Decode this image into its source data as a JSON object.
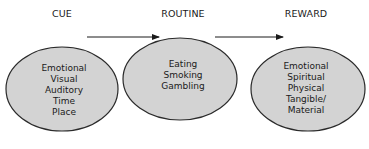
{
  "diagram": {
    "colors": {
      "ellipse_fill": "#d3d3d3",
      "ellipse_stroke": "#2a2a2a",
      "arrow": "#1a1a1a",
      "text": "#1a1a1a"
    },
    "stages": [
      {
        "label": "CUE",
        "items": [
          "Emotional",
          "Visual",
          "Auditory",
          "Time",
          "Place"
        ]
      },
      {
        "label": "ROUTINE",
        "items": [
          "Eating",
          "Smoking",
          "Gambling"
        ]
      },
      {
        "label": "REWARD",
        "items": [
          "Emotional",
          "Spiritual",
          "Physical",
          "Tangible/",
          "Material"
        ]
      }
    ],
    "arrows": [
      {
        "from": "CUE",
        "to": "ROUTINE"
      },
      {
        "from": "ROUTINE",
        "to": "REWARD"
      }
    ]
  }
}
